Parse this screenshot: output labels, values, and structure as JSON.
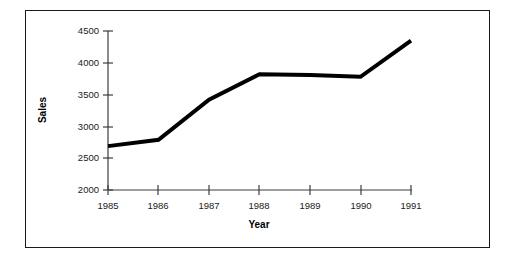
{
  "chart_data": {
    "type": "line",
    "title": "",
    "xlabel": "Year",
    "ylabel": "Sales",
    "categories": [
      "1985",
      "1986",
      "1987",
      "1988",
      "1989",
      "1990",
      "1991"
    ],
    "x": [
      1985,
      1986,
      1987,
      1988,
      1989,
      1990,
      1991
    ],
    "values": [
      2690,
      2790,
      3420,
      3820,
      3810,
      3780,
      4350
    ],
    "series": [
      {
        "name": "Sales",
        "values": [
          2690,
          2790,
          3420,
          3820,
          3810,
          3780,
          4350
        ],
        "color": "#000000",
        "line_width": 4,
        "markers": "none"
      }
    ],
    "ylim": [
      2000,
      4500
    ],
    "yticks": [
      2000,
      2500,
      3000,
      3500,
      4000,
      4500
    ],
    "ytick_labels": [
      "2000",
      "2500",
      "3000",
      "3500",
      "4000",
      "4500"
    ],
    "xticks": [
      1985,
      1986,
      1987,
      1988,
      1989,
      1990,
      1991
    ],
    "xtick_labels": [
      "1985",
      "1986",
      "1987",
      "1988",
      "1989",
      "1990",
      "1991"
    ],
    "grid": false,
    "legend": false,
    "legend_position": "none",
    "background_color": "#ffffff",
    "axis_color": "#3d3d3d",
    "frame_border_color": "#1a1a1a"
  }
}
